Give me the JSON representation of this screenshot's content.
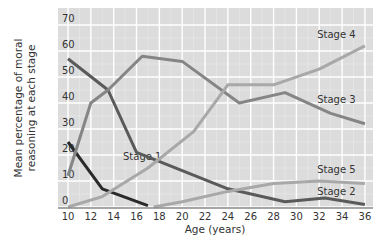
{
  "chart_data": {
    "type": "line",
    "title": "",
    "xlabel": "Age (years)",
    "ylabel": "Mean percentage of moral reasoning at each stage",
    "xlim": [
      9,
      37
    ],
    "ylim": [
      -1,
      73
    ],
    "xticks": [
      10,
      12,
      14,
      16,
      18,
      20,
      22,
      24,
      26,
      28,
      30,
      32,
      34,
      36
    ],
    "yticks": [
      0,
      10,
      20,
      30,
      40,
      50,
      60,
      70
    ],
    "grid": true,
    "series": [
      {
        "name": "Stage 1",
        "color": "#2a2a2a",
        "points": [
          [
            10,
            25
          ],
          [
            13,
            7
          ],
          [
            17,
            0.5
          ]
        ],
        "label_pos": [
          16.5,
          18
        ]
      },
      {
        "name": "Stage 2",
        "color": "#5a5a5a",
        "points": [
          [
            10,
            57
          ],
          [
            13.5,
            45
          ],
          [
            16,
            21
          ],
          [
            20,
            14
          ],
          [
            24,
            7
          ],
          [
            29,
            2
          ],
          [
            32.5,
            3.5
          ],
          [
            36,
            1
          ]
        ],
        "label_pos": [
          33.5,
          4.5
        ]
      },
      {
        "name": "Stage 3",
        "color": "#858585",
        "points": [
          [
            10,
            12
          ],
          [
            12,
            40
          ],
          [
            13.5,
            45
          ],
          [
            16.5,
            58
          ],
          [
            20,
            56
          ],
          [
            25,
            40
          ],
          [
            29,
            44
          ],
          [
            33,
            36
          ],
          [
            36,
            32
          ]
        ],
        "label_pos": [
          33.5,
          40
        ]
      },
      {
        "name": "Stage 4",
        "color": "#a8a8a8",
        "points": [
          [
            10,
            0
          ],
          [
            13,
            4
          ],
          [
            17,
            15
          ],
          [
            21,
            29
          ],
          [
            24,
            47
          ],
          [
            28,
            47
          ],
          [
            32,
            53
          ],
          [
            36,
            62
          ]
        ],
        "label_pos": [
          33.5,
          65
        ]
      },
      {
        "name": "Stage 5",
        "color": "#a8a8a8",
        "points": [
          [
            17.5,
            0
          ],
          [
            20,
            2
          ],
          [
            24,
            6
          ],
          [
            28,
            9
          ],
          [
            32,
            10
          ],
          [
            36,
            9
          ]
        ],
        "label_pos": [
          33.5,
          13
        ]
      }
    ]
  }
}
